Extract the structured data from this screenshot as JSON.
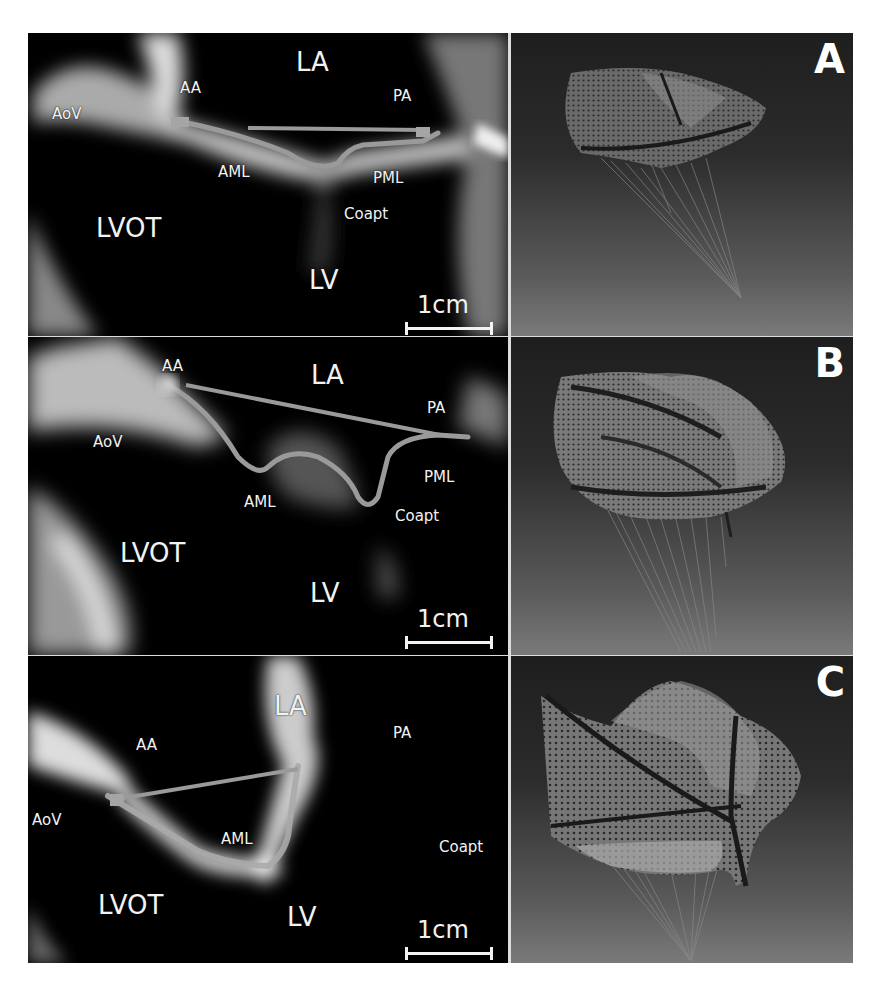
{
  "figure": {
    "panels": [
      {
        "letter": "A",
        "echo_labels": {
          "LA": "LA",
          "AA": "AA",
          "PA": "PA",
          "AoV": "AoV",
          "AML": "AML",
          "PML": "PML",
          "Coapt": "Coapt",
          "LVOT": "LVOT",
          "LV": "LV"
        },
        "scale": "1cm"
      },
      {
        "letter": "B",
        "echo_labels": {
          "LA": "LA",
          "AA": "AA",
          "PA": "PA",
          "AoV": "AoV",
          "AML": "AML",
          "PML": "PML",
          "Coapt": "Coapt",
          "LVOT": "LVOT",
          "LV": "LV"
        },
        "scale": "1cm"
      },
      {
        "letter": "C",
        "echo_labels": {
          "LA": "LA",
          "AA": "AA",
          "PA": "PA",
          "AoV": "AoV",
          "AML": "AML",
          "Coapt": "Coapt",
          "LVOT": "LVOT",
          "LV": "LV"
        },
        "scale": "1cm"
      }
    ],
    "colors": {
      "echo_background": "#000000",
      "label_text": "#f2f2f2",
      "trace": "#9a9a9a",
      "render_top": "#1e1e1e",
      "render_bottom": "#7a7a7a"
    }
  }
}
